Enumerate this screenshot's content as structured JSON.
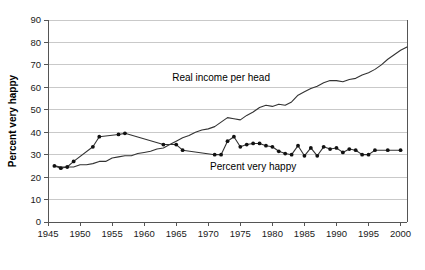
{
  "chart_data": {
    "type": "line",
    "title": "",
    "xlabel": "",
    "ylabel": "Percent very happy",
    "xlim": [
      1945,
      2001
    ],
    "ylim": [
      0,
      90
    ],
    "grid": true,
    "legend_position": "inline-annotations",
    "xticks": [
      "1945",
      "1950",
      "1955",
      "1960",
      "1965",
      "1970",
      "1975",
      "1980",
      "1985",
      "1990",
      "1995",
      "2000"
    ],
    "yticks": [
      "0",
      "10",
      "20",
      "30",
      "40",
      "50",
      "60",
      "70",
      "80",
      "90"
    ],
    "annotations": [
      {
        "text": "Real income per head",
        "x": 1972,
        "y": 63
      },
      {
        "text": "Percent very happy",
        "x": 1977,
        "y": 23
      }
    ],
    "series": [
      {
        "name": "Real income per head",
        "markers": false,
        "x": [
          1946,
          1947,
          1948,
          1949,
          1950,
          1951,
          1952,
          1953,
          1954,
          1955,
          1956,
          1957,
          1958,
          1959,
          1960,
          1961,
          1962,
          1963,
          1964,
          1965,
          1966,
          1967,
          1968,
          1969,
          1970,
          1971,
          1972,
          1973,
          1974,
          1975,
          1976,
          1977,
          1978,
          1979,
          1980,
          1981,
          1982,
          1983,
          1984,
          1985,
          1986,
          1987,
          1988,
          1989,
          1990,
          1991,
          1992,
          1993,
          1994,
          1995,
          1996,
          1997,
          1998,
          1999,
          2000,
          2001
        ],
        "values": [
          25,
          24.5,
          24.5,
          24.5,
          25.5,
          25.5,
          26,
          27,
          27,
          28.5,
          29,
          29.5,
          29.5,
          30.5,
          31,
          31.5,
          32.5,
          33,
          34.5,
          36,
          37.5,
          38.5,
          40,
          41,
          41.5,
          42.5,
          44.5,
          46.5,
          46,
          45.5,
          47.5,
          49,
          51,
          52,
          51.5,
          52.5,
          52,
          53.5,
          56.5,
          58,
          59.5,
          60.5,
          62,
          63,
          63,
          62.5,
          63.5,
          64,
          65.5,
          66.5,
          68,
          70,
          72.5,
          74.5,
          76.5,
          78
        ]
      },
      {
        "name": "Percent very happy",
        "markers": true,
        "x": [
          1946,
          1947,
          1948,
          1949,
          1952,
          1953,
          1956,
          1957,
          1963,
          1965,
          1966,
          1971,
          1972,
          1973,
          1974,
          1975,
          1976,
          1977,
          1978,
          1979,
          1980,
          1981,
          1982,
          1983,
          1984,
          1985,
          1986,
          1987,
          1988,
          1989,
          1990,
          1991,
          1992,
          1993,
          1994,
          1995,
          1996,
          1998,
          2000
        ],
        "values": [
          25,
          24,
          24.5,
          27,
          33.5,
          38,
          39,
          39.5,
          34.5,
          34.5,
          32,
          30,
          30,
          36,
          38,
          33.5,
          34.5,
          35,
          35,
          34,
          33.5,
          31.5,
          30.5,
          30,
          34,
          29.5,
          33,
          29.5,
          33.5,
          32.5,
          33,
          31,
          32.5,
          32,
          30,
          30,
          32,
          32,
          32
        ]
      }
    ]
  }
}
